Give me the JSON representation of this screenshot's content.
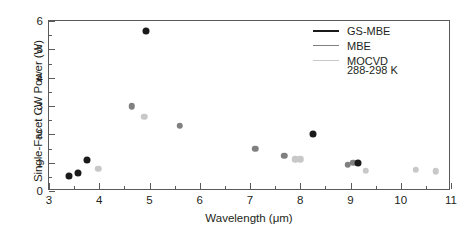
{
  "chart_data": {
    "type": "scatter",
    "title": "",
    "xlabel": "Wavelength (μm)",
    "ylabel": "Single-Facet CW Power (W)",
    "xlim": [
      3,
      11
    ],
    "ylim": [
      0,
      6
    ],
    "xticks": [
      3,
      4,
      5,
      6,
      7,
      8,
      9,
      10,
      11
    ],
    "yticks": [
      0,
      1,
      2,
      3,
      4,
      5,
      6
    ],
    "xtick_labels": [
      "3",
      "4",
      "5",
      "6",
      "7",
      "8",
      "9",
      "10",
      "11"
    ],
    "ytick_labels": [
      "0",
      "1",
      "2",
      "3",
      "4",
      "5",
      "6"
    ],
    "x_minor_step": 0.5,
    "y_minor_step": 0.5,
    "grid": false,
    "legend_position": "top-right",
    "annotation": "288-298 K",
    "series": [
      {
        "name": "GS-MBE",
        "color": "#1a1a1a",
        "points": [
          {
            "x": 3.4,
            "y": 0.52
          },
          {
            "x": 3.57,
            "y": 0.63
          },
          {
            "x": 3.75,
            "y": 1.1
          },
          {
            "x": 4.93,
            "y": 5.65
          },
          {
            "x": 8.25,
            "y": 2.0
          },
          {
            "x": 9.15,
            "y": 1.0
          }
        ]
      },
      {
        "name": "MBE",
        "color": "#808080",
        "points": [
          {
            "x": 4.65,
            "y": 3.0
          },
          {
            "x": 5.6,
            "y": 2.3
          },
          {
            "x": 7.1,
            "y": 1.5
          },
          {
            "x": 7.68,
            "y": 1.25
          },
          {
            "x": 8.95,
            "y": 0.92
          },
          {
            "x": 9.05,
            "y": 1.0
          }
        ]
      },
      {
        "name": "MOCVD",
        "color": "#c8c8c8",
        "points": [
          {
            "x": 3.98,
            "y": 0.78
          },
          {
            "x": 4.9,
            "y": 2.62
          },
          {
            "x": 7.9,
            "y": 1.12
          },
          {
            "x": 8.0,
            "y": 1.12
          },
          {
            "x": 9.3,
            "y": 0.72
          },
          {
            "x": 10.3,
            "y": 0.75
          },
          {
            "x": 10.7,
            "y": 0.7
          }
        ]
      }
    ]
  }
}
